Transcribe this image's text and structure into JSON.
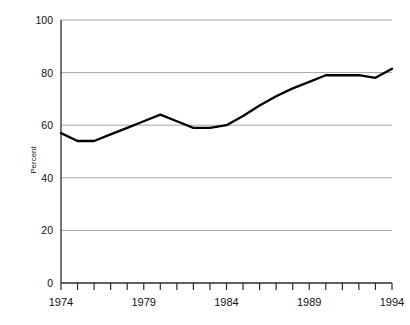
{
  "chart_data": {
    "type": "line",
    "title": "",
    "xlabel": "",
    "ylabel": "Percent",
    "xlim": [
      1974,
      1994
    ],
    "ylim": [
      0,
      100
    ],
    "grid": true,
    "legend": "none",
    "y_ticks": [
      0,
      20,
      40,
      60,
      80,
      100
    ],
    "y_tick_labels": [
      "0",
      "20",
      "40",
      "60",
      "80",
      "100"
    ],
    "x_ticks": [
      1974,
      1975,
      1976,
      1977,
      1978,
      1979,
      1980,
      1981,
      1982,
      1983,
      1984,
      1985,
      1986,
      1987,
      1988,
      1989,
      1990,
      1991,
      1992,
      1993,
      1994
    ],
    "x_tick_labels_shown": [
      "1974",
      "1979",
      "1984",
      "1989",
      "1994"
    ],
    "x_labeled_values": [
      1974,
      1979,
      1984,
      1989,
      1994
    ],
    "series": [
      {
        "name": "Percent",
        "x": [
          1974,
          1975,
          1976,
          1977,
          1978,
          1979,
          1980,
          1981,
          1982,
          1983,
          1984,
          1985,
          1986,
          1987,
          1988,
          1989,
          1990,
          1991,
          1992,
          1993,
          1994
        ],
        "values": [
          57,
          54,
          54,
          56.5,
          59,
          61.5,
          64,
          61.5,
          59,
          59,
          60,
          63.5,
          67.5,
          71,
          74,
          76.5,
          79,
          79,
          79,
          78,
          81.5
        ]
      }
    ]
  },
  "axis": {
    "y_label": "Percent"
  }
}
